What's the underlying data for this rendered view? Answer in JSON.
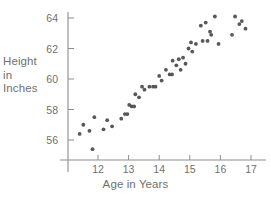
{
  "chart_data": {
    "type": "scatter",
    "title": "",
    "xlabel": "Age in Years",
    "ylabel": "Height in Inches",
    "ylabel_lines": [
      "Height",
      "in",
      "Inches"
    ],
    "xticks": [
      12,
      13,
      14,
      15,
      16,
      17
    ],
    "yticks": [
      56,
      58,
      60,
      62,
      64
    ],
    "xlim": [
      11.25,
      17.35
    ],
    "ylim": [
      54.9,
      64.6
    ],
    "grid": false,
    "legend": null,
    "marker_color": "#575757",
    "axis_color": "#8d8d8d",
    "text_color": "#6f6f6f",
    "points": [
      {
        "x": 11.4,
        "y": 56.4
      },
      {
        "x": 11.52,
        "y": 57.0
      },
      {
        "x": 11.72,
        "y": 56.6
      },
      {
        "x": 11.82,
        "y": 55.4
      },
      {
        "x": 11.88,
        "y": 57.5
      },
      {
        "x": 12.18,
        "y": 56.7
      },
      {
        "x": 12.3,
        "y": 57.3
      },
      {
        "x": 12.46,
        "y": 56.9
      },
      {
        "x": 12.76,
        "y": 57.4
      },
      {
        "x": 12.88,
        "y": 57.7
      },
      {
        "x": 12.96,
        "y": 57.7
      },
      {
        "x": 13.02,
        "y": 58.3
      },
      {
        "x": 13.1,
        "y": 58.2
      },
      {
        "x": 13.18,
        "y": 58.2
      },
      {
        "x": 13.22,
        "y": 59.0
      },
      {
        "x": 13.34,
        "y": 58.8
      },
      {
        "x": 13.44,
        "y": 59.5
      },
      {
        "x": 13.52,
        "y": 59.3
      },
      {
        "x": 13.68,
        "y": 59.5
      },
      {
        "x": 13.8,
        "y": 59.5
      },
      {
        "x": 13.88,
        "y": 59.5
      },
      {
        "x": 14.0,
        "y": 60.2
      },
      {
        "x": 14.08,
        "y": 59.9
      },
      {
        "x": 14.22,
        "y": 60.6
      },
      {
        "x": 14.34,
        "y": 60.3
      },
      {
        "x": 14.42,
        "y": 60.3
      },
      {
        "x": 14.44,
        "y": 61.2
      },
      {
        "x": 14.56,
        "y": 60.9
      },
      {
        "x": 14.64,
        "y": 61.3
      },
      {
        "x": 14.7,
        "y": 60.6
      },
      {
        "x": 14.78,
        "y": 61.4
      },
      {
        "x": 14.86,
        "y": 61.0
      },
      {
        "x": 14.96,
        "y": 62.0
      },
      {
        "x": 15.04,
        "y": 62.4
      },
      {
        "x": 15.08,
        "y": 61.8
      },
      {
        "x": 15.2,
        "y": 62.3
      },
      {
        "x": 15.36,
        "y": 63.5
      },
      {
        "x": 15.42,
        "y": 62.5
      },
      {
        "x": 15.52,
        "y": 63.7
      },
      {
        "x": 15.58,
        "y": 62.5
      },
      {
        "x": 15.66,
        "y": 63.1
      },
      {
        "x": 15.7,
        "y": 62.9
      },
      {
        "x": 15.82,
        "y": 64.1
      },
      {
        "x": 15.94,
        "y": 62.3
      },
      {
        "x": 16.38,
        "y": 62.9
      },
      {
        "x": 16.48,
        "y": 64.1
      },
      {
        "x": 16.62,
        "y": 63.6
      },
      {
        "x": 16.7,
        "y": 63.8
      },
      {
        "x": 16.82,
        "y": 63.3
      }
    ]
  }
}
